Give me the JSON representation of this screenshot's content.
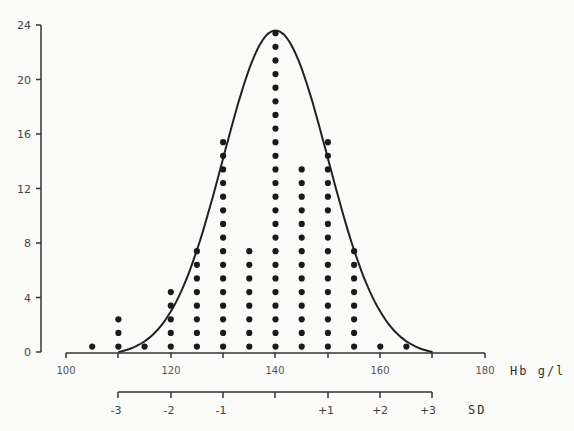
{
  "chart_data": {
    "type": "scatter",
    "subtype": "dot histogram with fitted normal curve",
    "title": "",
    "xlabel": "Hb g/l",
    "ylabel": "",
    "secondary_xlabel": "SD",
    "xlim": [
      100,
      180
    ],
    "ylim": [
      0,
      24
    ],
    "x_ticks": [
      100,
      120,
      140,
      160,
      180
    ],
    "x_minor_ticks": [
      110,
      130,
      150,
      170
    ],
    "y_ticks": [
      0,
      4,
      8,
      12,
      16,
      20,
      24
    ],
    "sd_ticks": [
      {
        "label": "-3",
        "x": 110
      },
      {
        "label": "-2",
        "x": 120
      },
      {
        "label": "-1",
        "x": 130
      },
      {
        "label": "",
        "x": 140
      },
      {
        "label": "+1",
        "x": 150
      },
      {
        "label": "+2",
        "x": 160
      },
      {
        "label": "+3",
        "x": 170
      }
    ],
    "categories": [
      105,
      110,
      115,
      120,
      125,
      130,
      135,
      140,
      145,
      150,
      155,
      160,
      165
    ],
    "values": [
      1,
      3,
      1,
      5,
      8,
      16,
      8,
      24,
      14,
      16,
      8,
      1,
      1
    ],
    "curve": {
      "type": "normal",
      "mean": 140,
      "sd": 10,
      "peak": 23.6,
      "range": [
        110,
        170
      ]
    },
    "grid": false,
    "legend": null
  },
  "labels": {
    "y_ticks": [
      "0",
      "4",
      "8",
      "12",
      "16",
      "20",
      "24"
    ],
    "x_ticks": [
      "100",
      "120",
      "140",
      "160",
      "180"
    ],
    "x_title": "Hb g/l",
    "sd_ticks": [
      "-3",
      "-2",
      "-1",
      "+1",
      "+2",
      "+3"
    ],
    "sd_title": "SD"
  }
}
